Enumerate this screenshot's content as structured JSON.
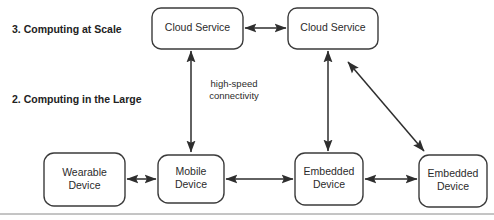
{
  "diagram": {
    "canvas": {
      "width": 494,
      "height": 220,
      "background": "#ffffff"
    },
    "colors": {
      "node_stroke": "#3b3b3b",
      "node_fill": "#ffffff",
      "arrow": "#2e2e2e",
      "text": "#2b2b2b",
      "tier_text": "#222222",
      "rule": "#8a8a8a"
    },
    "tier_labels": [
      {
        "id": "tier-3",
        "text": "3. Computing at Scale",
        "x": 12,
        "y": 30
      },
      {
        "id": "tier-2",
        "text": "2. Computing in the Large",
        "x": 12,
        "y": 100
      }
    ],
    "nodes": [
      {
        "id": "cloud-service-left",
        "label": "Cloud Service",
        "lines": [
          "Cloud Service"
        ],
        "x": 152,
        "y": 8,
        "w": 91,
        "h": 41,
        "r": 9
      },
      {
        "id": "cloud-service-right",
        "label": "Cloud Service",
        "lines": [
          "Cloud Service"
        ],
        "x": 288,
        "y": 8,
        "w": 90,
        "h": 41,
        "r": 9
      },
      {
        "id": "wearable-device",
        "label": "Wearable Device",
        "lines": [
          "Wearable",
          "Device"
        ],
        "x": 44,
        "y": 153,
        "w": 81,
        "h": 53,
        "r": 10
      },
      {
        "id": "mobile-device",
        "label": "Mobile Device",
        "lines": [
          "Mobile",
          "Device"
        ],
        "x": 158,
        "y": 155,
        "w": 66,
        "h": 48,
        "r": 10
      },
      {
        "id": "embedded-device-1",
        "label": "Embedded Device",
        "lines": [
          "Embedded",
          "Device"
        ],
        "x": 295,
        "y": 153,
        "w": 68,
        "h": 52,
        "r": 10
      },
      {
        "id": "embedded-device-2",
        "label": "Embedded Device",
        "lines": [
          "Embedded",
          "Device"
        ],
        "x": 419,
        "y": 155,
        "w": 68,
        "h": 52,
        "r": 10
      }
    ],
    "edges": [
      {
        "id": "edge-cloud-left-cloud-right",
        "from": "cloud-service-left",
        "to": "cloud-service-right",
        "arrowheads": "both",
        "x1": 245,
        "y1": 28,
        "x2": 286,
        "y2": 28
      },
      {
        "id": "edge-cloud-left-mobile",
        "from": "cloud-service-left",
        "to": "mobile-device",
        "arrowheads": "both",
        "x1": 191,
        "y1": 152,
        "x2": 191,
        "y2": 51
      },
      {
        "id": "edge-cloud-right-embedded-1",
        "from": "cloud-service-right",
        "to": "embedded-device-1",
        "arrowheads": "both",
        "x1": 328,
        "y1": 151,
        "x2": 328,
        "y2": 51
      },
      {
        "id": "edge-cloud-right-embedded-2",
        "from": "cloud-service-right",
        "to": "embedded-device-2",
        "arrowheads": "both",
        "x1": 424,
        "y1": 151,
        "x2": 348,
        "y2": 62
      },
      {
        "id": "edge-wearable-mobile",
        "from": "wearable-device",
        "to": "mobile-device",
        "arrowheads": "both",
        "x1": 127,
        "y1": 179,
        "x2": 156,
        "y2": 179
      },
      {
        "id": "edge-mobile-embedded-1",
        "from": "mobile-device",
        "to": "embedded-device-1",
        "arrowheads": "both",
        "x1": 226,
        "y1": 179,
        "x2": 293,
        "y2": 179
      },
      {
        "id": "edge-embedded-1-embedded-2",
        "from": "embedded-device-1",
        "to": "embedded-device-2",
        "arrowheads": "both",
        "x1": 365,
        "y1": 179,
        "x2": 417,
        "y2": 179
      }
    ],
    "edge_labels": [
      {
        "id": "high-speed-connectivity",
        "lines": [
          "high-speed",
          "connectivity"
        ],
        "text": "high-speed connectivity",
        "x": 234,
        "y": 90
      }
    ],
    "rules": [
      {
        "id": "bottom-rule",
        "x1": 0,
        "y1": 214,
        "x2": 494,
        "y2": 214
      }
    ]
  }
}
